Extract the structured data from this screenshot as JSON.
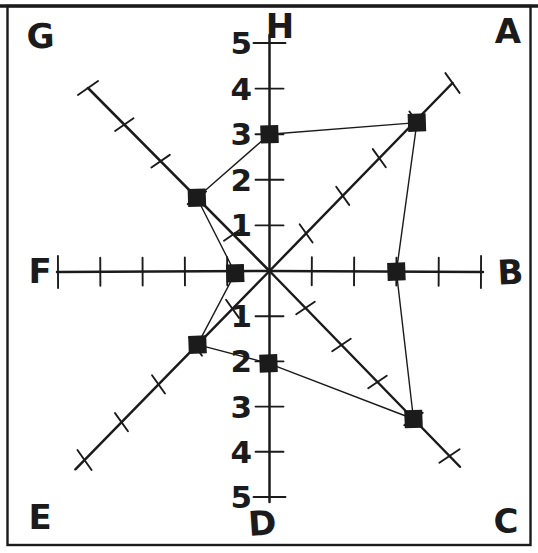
{
  "page": {
    "background": "#ffffff",
    "ink_color": "#1b1b1b",
    "frame": "single rectangular hand-drawn border"
  },
  "chart_data": {
    "type": "radar",
    "title": "",
    "axis_max": 5,
    "axis_min": 0,
    "tick_values": [
      1,
      2,
      3,
      4,
      5
    ],
    "grid": false,
    "legend": false,
    "marker": "filled-square",
    "marker_color": "#1b1b1b",
    "line_color": "#1b1b1b",
    "axes": [
      {
        "label": "H",
        "direction": "up",
        "value": 3,
        "numeric_scale_visible": true,
        "tick_label_side": "left"
      },
      {
        "label": "A",
        "direction": "up-right",
        "value": 4,
        "numeric_scale_visible": false
      },
      {
        "label": "B",
        "direction": "right",
        "value": 3,
        "numeric_scale_visible": false
      },
      {
        "label": "C",
        "direction": "down-right",
        "value": 4,
        "numeric_scale_visible": false
      },
      {
        "label": "D",
        "direction": "down",
        "value": 2,
        "numeric_scale_visible": true,
        "tick_label_side": "left"
      },
      {
        "label": "E",
        "direction": "down-left",
        "value": 2,
        "numeric_scale_visible": false
      },
      {
        "label": "F",
        "direction": "left",
        "value": 1,
        "numeric_scale_visible": false
      },
      {
        "label": "G",
        "direction": "up-left",
        "value": 2,
        "numeric_scale_visible": false
      }
    ],
    "series": [
      {
        "name": "profile",
        "order": [
          "H",
          "A",
          "B",
          "C",
          "D",
          "E",
          "F",
          "G"
        ],
        "values_by_axis": {
          "A": 4,
          "B": 3,
          "C": 4,
          "D": 2,
          "E": 2,
          "F": 1,
          "G": 2,
          "H": 3
        },
        "closed": true
      }
    ]
  }
}
